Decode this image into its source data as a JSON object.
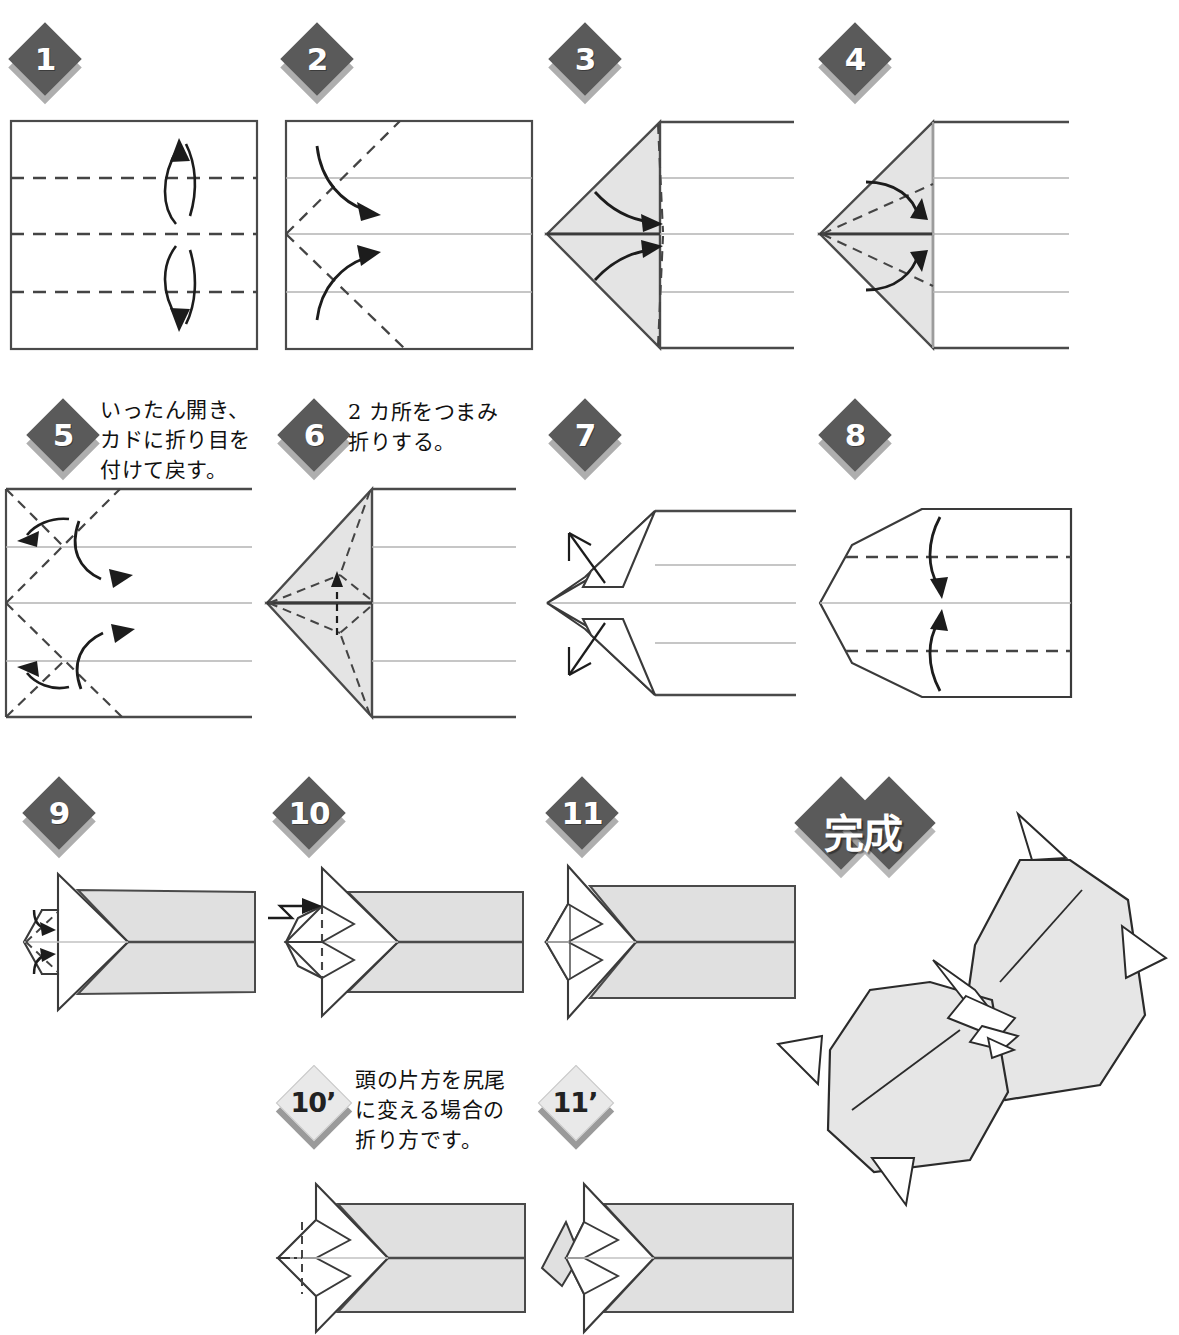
{
  "document": {
    "title": "おりがみ 折り方図",
    "type": "origami-instruction-diagram",
    "language": "ja"
  },
  "palette": {
    "badge_dark": "#5a5a5a",
    "badge_light": "#e9e9e9",
    "badge_text_light": "#ffffff",
    "badge_text_dark": "#222222",
    "paper_shade": "#e2e2e2",
    "line": "#2b2b2b",
    "line_soft": "#9a9a9a",
    "background": "#ffffff"
  },
  "steps": [
    {
      "id": "1",
      "badge": "1",
      "style": "dark",
      "caption": ""
    },
    {
      "id": "2",
      "badge": "2",
      "style": "dark",
      "caption": ""
    },
    {
      "id": "3",
      "badge": "3",
      "style": "dark",
      "caption": ""
    },
    {
      "id": "4",
      "badge": "4",
      "style": "dark",
      "caption": ""
    },
    {
      "id": "5",
      "badge": "5",
      "style": "dark",
      "caption": "いったん開き、\nカドに折り目を\n付けて戻す。"
    },
    {
      "id": "6",
      "badge": "6",
      "style": "dark",
      "caption": "2 カ所をつまみ\n折りする。"
    },
    {
      "id": "7",
      "badge": "7",
      "style": "dark",
      "caption": ""
    },
    {
      "id": "8",
      "badge": "8",
      "style": "dark",
      "caption": ""
    },
    {
      "id": "9",
      "badge": "9",
      "style": "dark",
      "caption": ""
    },
    {
      "id": "10",
      "badge": "10",
      "style": "dark",
      "caption": ""
    },
    {
      "id": "11",
      "badge": "11",
      "style": "dark",
      "caption": ""
    },
    {
      "id": "10p",
      "badge": "10’",
      "style": "light",
      "caption": "頭の片方を尻尾\nに変える場合の\n折り方です。"
    },
    {
      "id": "11p",
      "badge": "11’",
      "style": "light",
      "caption": ""
    }
  ],
  "finish": {
    "badge": "完成",
    "style": "dark-double",
    "figure_name": "finished-model"
  },
  "legend": {
    "valley_fold": "dashed-line",
    "fold_arrow": "curved-arrow",
    "push_arrow": "zigzag-arrow",
    "pull_arrow": "open-arrow"
  }
}
